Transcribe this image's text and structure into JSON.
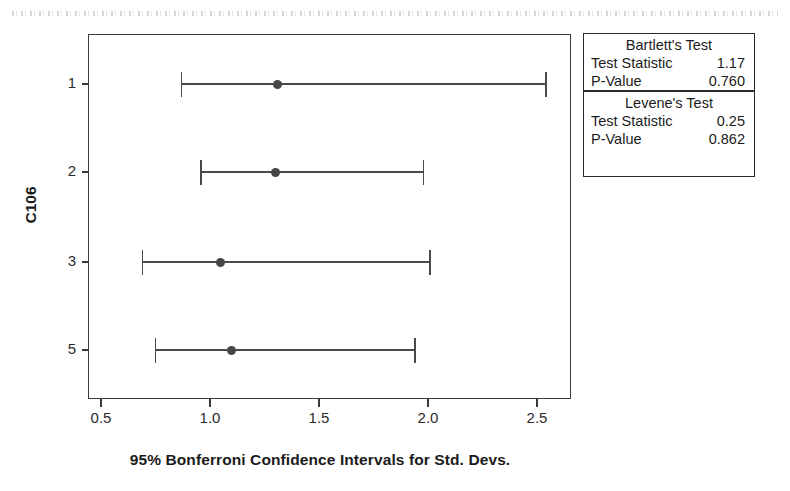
{
  "chart_data": {
    "type": "scatter",
    "title": "",
    "xlabel": "95% Bonferroni Confidence Intervals for Std. Devs.",
    "ylabel": "C106",
    "xlim": [
      0.29,
      2.45
    ],
    "xticks": [
      "0.5",
      "1.0",
      "1.5",
      "2.0",
      "2.5"
    ],
    "xtick_values": [
      0.5,
      1.0,
      1.5,
      2.0,
      2.5
    ],
    "categories": [
      "1",
      "2",
      "3",
      "5"
    ],
    "grid": false,
    "legend": null,
    "intervals": [
      {
        "category": "1",
        "center": 1.31,
        "lower": 0.87,
        "upper": 2.54
      },
      {
        "category": "2",
        "center": 1.3,
        "lower": 0.96,
        "upper": 1.98
      },
      {
        "category": "3",
        "center": 1.05,
        "lower": 0.69,
        "upper": 2.01
      },
      {
        "category": "5",
        "center": 1.1,
        "lower": 0.75,
        "upper": 1.94
      }
    ],
    "marker_color": "#474747",
    "line_color": "#4a4a4a",
    "frame_color": "#3a3a3a"
  },
  "stats_box": {
    "sections": [
      {
        "heading": "Bartlett's Test",
        "rows": [
          {
            "label": "Test Statistic",
            "value": "1.17"
          },
          {
            "label": "P-Value",
            "value": "0.760"
          }
        ]
      },
      {
        "heading": "Levene's Test",
        "rows": [
          {
            "label": "Test Statistic",
            "value": "0.25"
          },
          {
            "label": "P-Value",
            "value": "0.862"
          }
        ]
      }
    ]
  }
}
